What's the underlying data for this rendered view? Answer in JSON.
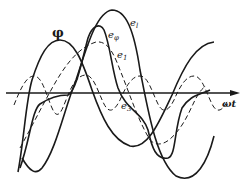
{
  "figure": {
    "axis": {
      "x_label": "ωt"
    },
    "curves": [
      {
        "name": "φ",
        "style": "solid",
        "label": "φ"
      },
      {
        "name": "e_l",
        "style": "solid",
        "label_base": "e",
        "label_sub": "l"
      },
      {
        "name": "e_φ",
        "style": "solid",
        "label_base": "e",
        "label_sub": "φ"
      },
      {
        "name": "e_1",
        "style": "dashed",
        "label_base": "e",
        "label_sub": "1"
      },
      {
        "name": "e_3",
        "style": "dashed",
        "label_base": "e",
        "label_sub": "3"
      }
    ],
    "colors": {
      "line": "#1a1a1a",
      "background": "#ffffff"
    }
  }
}
